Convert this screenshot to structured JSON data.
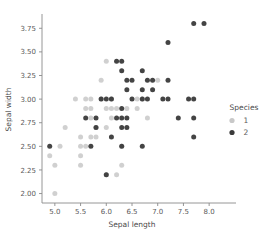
{
  "chart_data": {
    "type": "scatter",
    "title": "",
    "xlabel": "Sepal length",
    "ylabel": "Sepal width",
    "xlim": [
      4.75,
      8.25
    ],
    "ylim": [
      1.9,
      3.88
    ],
    "grid": false,
    "legend": {
      "title": "Species",
      "position": "right",
      "entries": [
        {
          "label": "1",
          "color": "#c8c8c8",
          "marker": "circle"
        },
        {
          "label": "2",
          "color": "#3a3a3a",
          "marker": "circle"
        }
      ]
    },
    "xticks": [
      "5.0",
      "5.5",
      "6.0",
      "6.5",
      "7.0",
      "7.5",
      "8.0"
    ],
    "xtick_values": [
      5.0,
      5.5,
      6.0,
      6.5,
      7.0,
      7.5,
      8.0
    ],
    "yticks": [
      "2.00",
      "2.25",
      "2.50",
      "2.75",
      "3.00",
      "3.25",
      "3.50",
      "3.75"
    ],
    "ytick_values": [
      2.0,
      2.25,
      2.5,
      2.75,
      3.0,
      3.25,
      3.5,
      3.75
    ],
    "series": [
      {
        "name": "1",
        "color": "#c8c8c8",
        "points": [
          [
            4.9,
            2.4
          ],
          [
            5.0,
            2.0
          ],
          [
            5.0,
            2.3
          ],
          [
            5.1,
            2.5
          ],
          [
            5.2,
            2.7
          ],
          [
            5.4,
            3.0
          ],
          [
            5.5,
            2.3
          ],
          [
            5.5,
            2.4
          ],
          [
            5.5,
            2.5
          ],
          [
            5.5,
            2.6
          ],
          [
            5.6,
            2.5
          ],
          [
            5.6,
            2.9
          ],
          [
            5.6,
            3.0
          ],
          [
            5.7,
            2.6
          ],
          [
            5.7,
            2.8
          ],
          [
            5.7,
            2.9
          ],
          [
            5.7,
            3.0
          ],
          [
            5.8,
            2.6
          ],
          [
            5.8,
            2.7
          ],
          [
            5.9,
            3.0
          ],
          [
            5.9,
            3.2
          ],
          [
            6.0,
            2.2
          ],
          [
            6.0,
            2.7
          ],
          [
            6.0,
            2.9
          ],
          [
            6.0,
            3.4
          ],
          [
            6.1,
            2.8
          ],
          [
            6.1,
            2.9
          ],
          [
            6.1,
            3.0
          ],
          [
            6.2,
            2.2
          ],
          [
            6.2,
            2.9
          ],
          [
            6.3,
            2.3
          ],
          [
            6.3,
            2.5
          ],
          [
            6.4,
            2.9
          ],
          [
            6.6,
            2.9
          ],
          [
            6.6,
            3.0
          ],
          [
            6.7,
            3.0
          ],
          [
            6.8,
            2.8
          ],
          [
            7.0,
            3.2
          ]
        ]
      },
      {
        "name": "2",
        "color": "#3a3a3a",
        "points": [
          [
            4.9,
            2.5
          ],
          [
            5.6,
            2.8
          ],
          [
            5.7,
            2.5
          ],
          [
            5.8,
            2.7
          ],
          [
            5.8,
            2.8
          ],
          [
            5.9,
            3.0
          ],
          [
            6.0,
            2.2
          ],
          [
            6.0,
            3.0
          ],
          [
            6.1,
            2.6
          ],
          [
            6.1,
            3.0
          ],
          [
            6.2,
            2.8
          ],
          [
            6.2,
            3.4
          ],
          [
            6.3,
            2.5
          ],
          [
            6.3,
            2.7
          ],
          [
            6.3,
            2.8
          ],
          [
            6.3,
            2.9
          ],
          [
            6.3,
            3.3
          ],
          [
            6.3,
            3.4
          ],
          [
            6.4,
            2.7
          ],
          [
            6.4,
            2.8
          ],
          [
            6.4,
            3.1
          ],
          [
            6.4,
            3.2
          ],
          [
            6.5,
            3.0
          ],
          [
            6.5,
            3.2
          ],
          [
            6.7,
            2.5
          ],
          [
            6.7,
            3.0
          ],
          [
            6.7,
            3.1
          ],
          [
            6.7,
            3.3
          ],
          [
            6.8,
            3.0
          ],
          [
            6.8,
            3.2
          ],
          [
            6.9,
            3.1
          ],
          [
            6.9,
            3.2
          ],
          [
            7.1,
            3.0
          ],
          [
            7.2,
            3.0
          ],
          [
            7.2,
            3.2
          ],
          [
            7.2,
            3.6
          ],
          [
            7.4,
            2.8
          ],
          [
            7.6,
            3.0
          ],
          [
            7.7,
            2.6
          ],
          [
            7.7,
            2.8
          ],
          [
            7.7,
            3.0
          ],
          [
            7.7,
            3.8
          ],
          [
            7.9,
            3.8
          ]
        ]
      }
    ]
  },
  "plot_geometry": {
    "left": 42,
    "right": 222,
    "top": 16,
    "bottom": 203
  }
}
